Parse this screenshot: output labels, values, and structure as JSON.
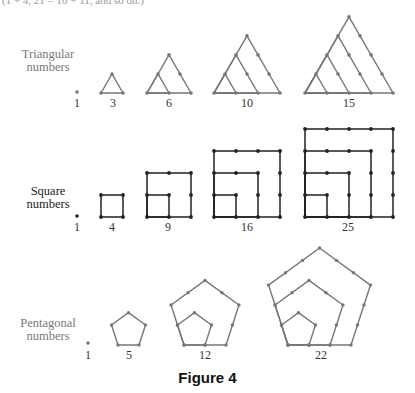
{
  "top_text": "(1 + 4, 21 = 10 + 11, and so on.)",
  "rows": [
    {
      "kind": "triangular",
      "label_line1": "Triangular",
      "label_line2": "numbers",
      "color": "#777777",
      "values": [
        "1",
        "3",
        "6",
        "10",
        "15"
      ]
    },
    {
      "kind": "square",
      "label_line1": "Square",
      "label_line2": "numbers",
      "color": "#222222",
      "values": [
        "1",
        "4",
        "9",
        "16",
        "25"
      ]
    },
    {
      "kind": "pentagonal",
      "label_line1": "Pentagonal",
      "label_line2": "numbers",
      "color": "#777777",
      "values": [
        "1",
        "5",
        "12",
        "22"
      ]
    }
  ],
  "caption": "Figure 4"
}
